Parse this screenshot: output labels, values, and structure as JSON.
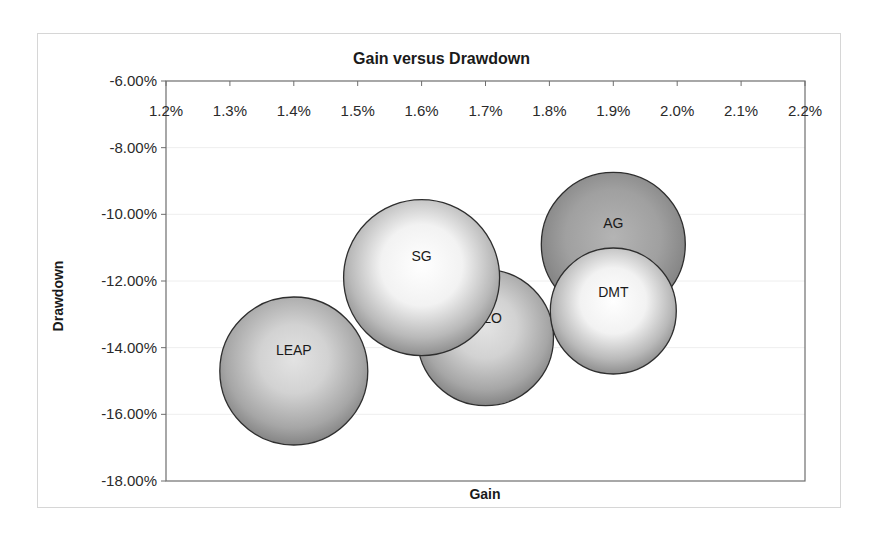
{
  "chart_data": {
    "type": "bubble",
    "title": "Gain versus Drawdown",
    "xlabel": "Gain",
    "ylabel": "Drawdown",
    "xlim": [
      1.2,
      2.2
    ],
    "ylim": [
      -18.0,
      -6.0
    ],
    "x_unit": "%",
    "y_unit": "%",
    "x_ticks": [
      "1.2%",
      "1.3%",
      "1.4%",
      "1.5%",
      "1.6%",
      "1.7%",
      "1.8%",
      "1.9%",
      "2.0%",
      "2.1%",
      "2.2%"
    ],
    "y_ticks": [
      "-6.00%",
      "-8.00%",
      "-10.00%",
      "-12.00%",
      "-14.00%",
      "-16.00%",
      "-18.00%"
    ],
    "x_axis_position": "top",
    "grid": true,
    "legend": false,
    "points": [
      {
        "label": "LEAP",
        "x": 1.4,
        "y": -14.7,
        "size": 74,
        "shade": "mid"
      },
      {
        "label": "HILO",
        "x": 1.7,
        "y": -13.7,
        "size": 68,
        "shade": "mid"
      },
      {
        "label": "SG",
        "x": 1.6,
        "y": -11.9,
        "size": 78,
        "shade": "light"
      },
      {
        "label": "AG",
        "x": 1.9,
        "y": -10.9,
        "size": 72,
        "shade": "dark"
      },
      {
        "label": "DMT",
        "x": 1.9,
        "y": -12.9,
        "size": 63,
        "shade": "light"
      }
    ]
  },
  "labels": {
    "title": "Gain versus Drawdown",
    "xlabel": "Gain",
    "ylabel": "Drawdown"
  }
}
